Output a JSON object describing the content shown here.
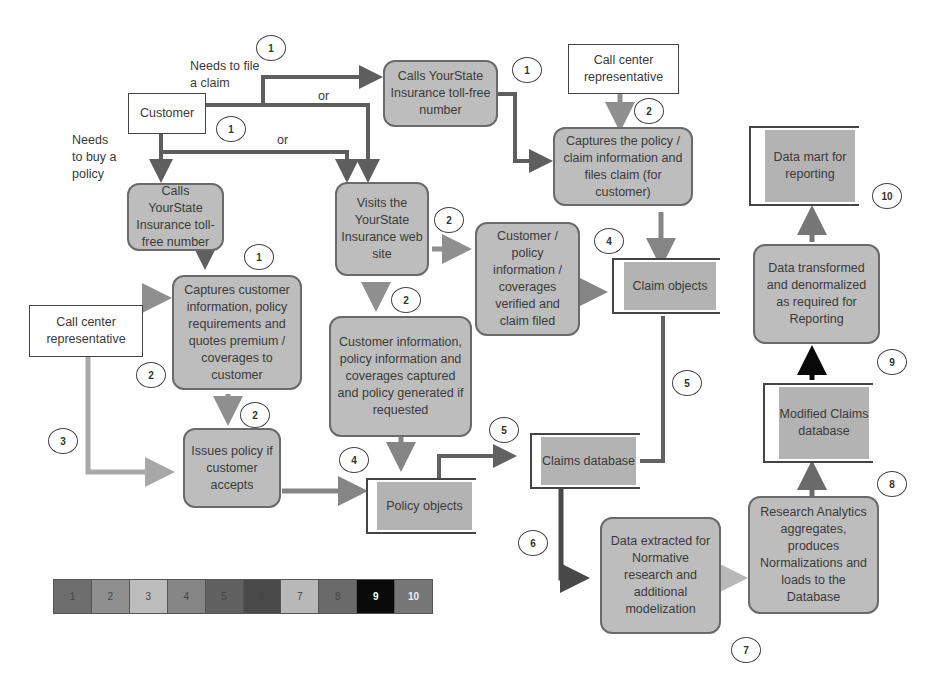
{
  "colors": {
    "step1": "#6e6e6e",
    "step2": "#8f8f8f",
    "step3": "#bdbdbd",
    "step4": "#858585",
    "step5": "#616161",
    "step6": "#4a4a4a",
    "step7": "#b8b8b8",
    "step8": "#6a6a6a",
    "step9": "#0a0a0a",
    "step10": "#777777"
  },
  "nodes": {
    "customer": "Customer",
    "calls_tollfree_claim": "Calls YourState Insurance toll-free number",
    "call_center_rep_top": "Call center representative",
    "captures_policy_claim": "Captures the policy / claim information and files claim (for customer)",
    "data_mart": "Data mart for reporting",
    "calls_tollfree_buy": "Calls YourState Insurance toll-free number",
    "visits_website": "Visits the YourState Insurance web site",
    "customer_policy_verified": "Customer / policy information / coverages verified and claim filed",
    "claim_objects": "Claim objects",
    "data_transformed": "Data transformed and denormalized as required for Reporting",
    "captures_customer_info": "Captures customer information, policy requirements and quotes premium / coverages to customer",
    "call_center_rep_left": "Call center representative",
    "customer_info_captured": "Customer information, policy information and coverages captured and policy generated if requested",
    "modified_claims_db": "Modified Claims database",
    "issues_policy": "Issues policy if customer accepts",
    "claims_database": "Claims database",
    "policy_objects": "Policy objects",
    "research_analytics": "Research Analytics aggregates, produces Normalizations and loads to the Database",
    "data_extracted": "Data extracted for Normative research and additional modelization"
  },
  "labels": {
    "needs_file_claim": "Needs to file a claim",
    "needs_buy_policy": "Needs to buy a policy",
    "or_top": "or",
    "or_mid": "or"
  },
  "badges": {
    "b1a": "1",
    "b1b": "1",
    "b1c": "1",
    "b1d": "1",
    "b2a": "2",
    "b2b": "2",
    "b2c": "2",
    "b2d": "2",
    "b2e": "2",
    "b3": "3",
    "b4a": "4",
    "b4b": "4",
    "b5a": "5",
    "b5b": "5",
    "b6": "6",
    "b7": "7",
    "b8": "8",
    "b9": "9",
    "b10": "10"
  },
  "legend": [
    "1",
    "2",
    "3",
    "4",
    "5",
    "6",
    "7",
    "8",
    "9",
    "10"
  ]
}
